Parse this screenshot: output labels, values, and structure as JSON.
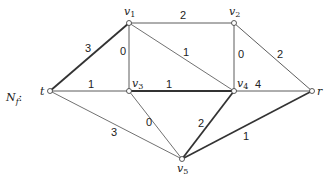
{
  "diagram": {
    "title_main": "N",
    "title_sub": "f",
    "title_suffix": ":",
    "nodes": [
      {
        "id": "t",
        "label": "t",
        "x": 50,
        "y": 91
      },
      {
        "id": "v1",
        "label": "v",
        "sub": "1",
        "x": 129,
        "y": 23
      },
      {
        "id": "v2",
        "label": "v",
        "sub": "2",
        "x": 234,
        "y": 23
      },
      {
        "id": "v3",
        "label": "v",
        "sub": "3",
        "x": 129,
        "y": 91
      },
      {
        "id": "v4",
        "label": "v",
        "sub": "4",
        "x": 234,
        "y": 91
      },
      {
        "id": "r",
        "label": "r",
        "x": 312,
        "y": 91
      },
      {
        "id": "v5",
        "label": "v",
        "sub": "5",
        "x": 182,
        "y": 159
      }
    ],
    "edges": [
      {
        "from": "t",
        "to": "v1",
        "weight": "3",
        "bold": true
      },
      {
        "from": "t",
        "to": "v3",
        "weight": "1",
        "bold": false
      },
      {
        "from": "t",
        "to": "v5",
        "weight": "3",
        "bold": false
      },
      {
        "from": "v1",
        "to": "v2",
        "weight": "2",
        "bold": false
      },
      {
        "from": "v1",
        "to": "v3",
        "weight": "0",
        "bold": false
      },
      {
        "from": "v1",
        "to": "v4",
        "weight": "1",
        "bold": false
      },
      {
        "from": "v3",
        "to": "v4",
        "weight": "1",
        "bold": true
      },
      {
        "from": "v4",
        "to": "v2",
        "weight": "0",
        "bold": false
      },
      {
        "from": "v2",
        "to": "r",
        "weight": "2",
        "bold": false
      },
      {
        "from": "v4",
        "to": "r",
        "weight": "4",
        "bold": false
      },
      {
        "from": "v5",
        "to": "v3",
        "weight": "0",
        "bold": false
      },
      {
        "from": "v5",
        "to": "v4",
        "weight": "2",
        "bold": true
      },
      {
        "from": "v5",
        "to": "r",
        "weight": "1",
        "bold": true
      }
    ]
  }
}
